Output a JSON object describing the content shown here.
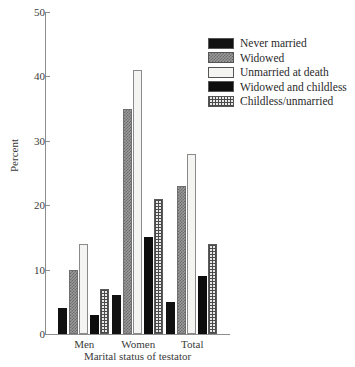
{
  "chart_data": {
    "type": "bar",
    "title": "",
    "xlabel": "Marital status of testator",
    "ylabel": "Percent",
    "categories": [
      "Men",
      "Women",
      "Total"
    ],
    "ylim": [
      0,
      50
    ],
    "yticks": [
      0,
      10,
      20,
      30,
      40,
      50
    ],
    "grid": false,
    "legend_position": "top-right",
    "series": [
      {
        "name": "Never married",
        "values": [
          4,
          6,
          5
        ],
        "pattern": "solid-black"
      },
      {
        "name": "Widowed",
        "values": [
          10,
          35,
          23
        ],
        "pattern": "gray-checker"
      },
      {
        "name": "Unmarried at death",
        "values": [
          14,
          41,
          28
        ],
        "pattern": "white"
      },
      {
        "name": "Widowed and childless",
        "values": [
          3,
          15,
          9
        ],
        "pattern": "solid-black"
      },
      {
        "name": "Childless/unmarried",
        "values": [
          7,
          21,
          14
        ],
        "pattern": "fine-grid"
      }
    ]
  },
  "axes": {
    "y_title": "Percent",
    "x_title": "Marital status of testator",
    "y_tick_labels": [
      "0",
      "10",
      "20",
      "30",
      "40",
      "50"
    ],
    "x_tick_labels": [
      "Men",
      "Women",
      "Total"
    ]
  },
  "legend": {
    "entries": [
      {
        "label": "Never married"
      },
      {
        "label": "Widowed"
      },
      {
        "label": "Unmarried at death"
      },
      {
        "label": "Widowed and childless"
      },
      {
        "label": "Childless/unmarried"
      }
    ]
  }
}
